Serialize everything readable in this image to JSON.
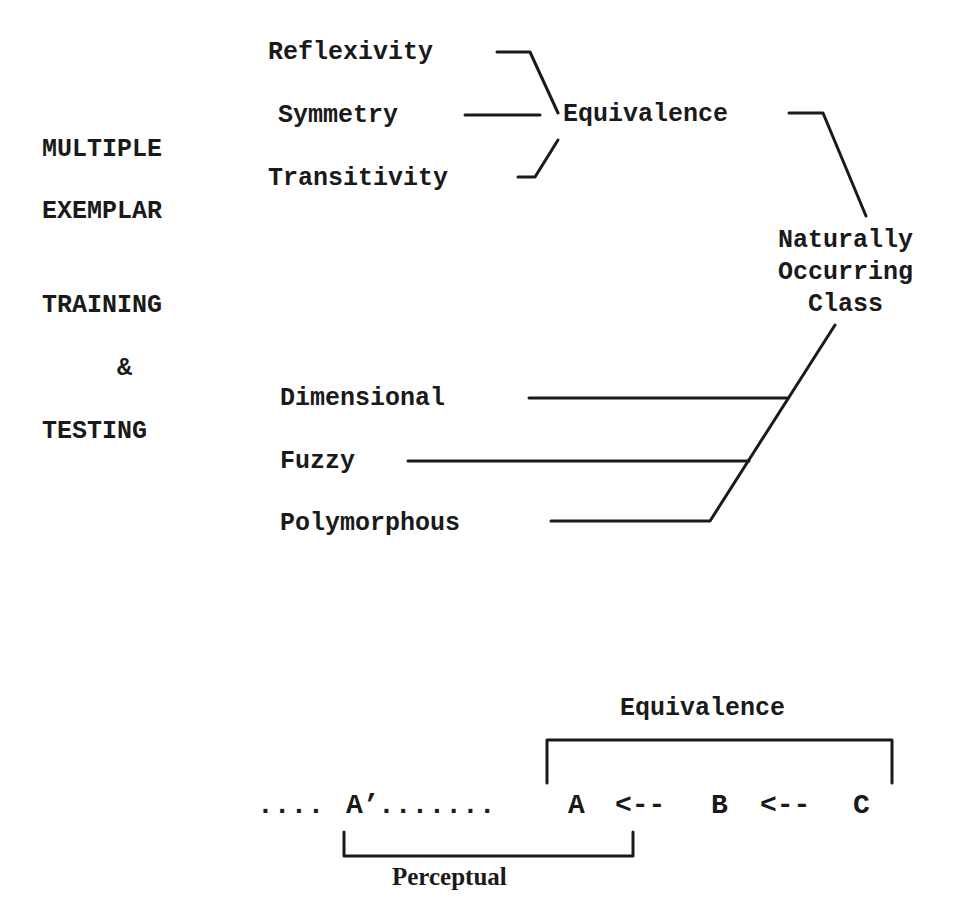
{
  "left_panel": {
    "lines": [
      "MULTIPLE",
      "EXEMPLAR",
      "TRAINING",
      "&",
      "TESTING"
    ]
  },
  "equivalence_tree": {
    "properties": [
      "Reflexivity",
      "Symmetry",
      "Transitivity"
    ],
    "parent": "Equivalence"
  },
  "class_node": {
    "lines": [
      "Naturally",
      "Occurring",
      "Class"
    ]
  },
  "class_types": [
    "Dimensional",
    "Fuzzy",
    "Polymorphous"
  ],
  "sequence": {
    "leading_dots": "....",
    "a_prime": "A’",
    "middle_dots": ".......",
    "a": "A",
    "arrow1": "<--",
    "b": "B",
    "arrow2": "<--",
    "c": "C",
    "top_bracket_label": "Equivalence",
    "bottom_bracket_label": "Perceptual"
  }
}
